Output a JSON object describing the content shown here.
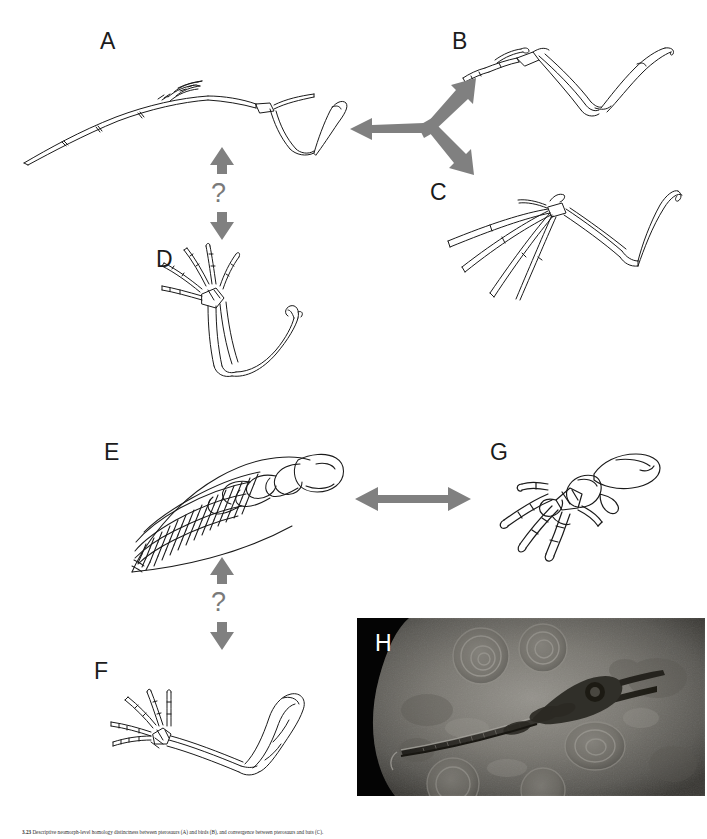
{
  "figure": {
    "background_color": "#ffffff",
    "arrow_color": "#808080",
    "ink_color": "#1a1a1a",
    "width": 707,
    "height": 839
  },
  "panels": [
    {
      "id": "A",
      "label": "A",
      "name": "pterosaur-wing",
      "description": "Pterosaur wing with hyper-elongated fourth digit",
      "label_x": 100,
      "label_y": 30
    },
    {
      "id": "B",
      "label": "B",
      "name": "bird-wing",
      "description": "Bird wing skeleton",
      "label_x": 452,
      "label_y": 30
    },
    {
      "id": "C",
      "label": "C",
      "name": "bat-wing",
      "description": "Bat wing with elongated digits",
      "label_x": 430,
      "label_y": 181
    },
    {
      "id": "D",
      "label": "D",
      "name": "generalized-tetrapod-forelimb",
      "description": "Generalized tetrapod forelimb with five short digits",
      "label_x": 156,
      "label_y": 248
    },
    {
      "id": "E",
      "label": "E",
      "name": "ichthyosaur-paddle",
      "description": "Ichthyosaur paddle with hyperphalangy",
      "label_x": 104,
      "label_y": 441
    },
    {
      "id": "F",
      "label": "F",
      "name": "generalized-forelimb",
      "description": "Generalized forelimb with humerus, radius, ulna and digits",
      "label_x": 94,
      "label_y": 660
    },
    {
      "id": "G",
      "label": "G",
      "name": "terrestrial-manus",
      "description": "Terrestrial manus with separate clawed digits",
      "label_x": 490,
      "label_y": 441
    },
    {
      "id": "H",
      "label": "H",
      "name": "ichthyosaur-fossil-photograph",
      "description": "Photograph of an ichthyosaur fossil in rock matrix with ammonites",
      "label_x": 375,
      "label_y": 632
    }
  ],
  "connectors": [
    {
      "name": "arrow-a-to-b-and-c",
      "type": "three-way-arrow",
      "from": "A",
      "to": [
        "B",
        "C"
      ],
      "question": false,
      "color": "#808080"
    },
    {
      "name": "arrow-a-to-d",
      "type": "double-headed-vertical-arrow",
      "from": "A",
      "to": "D",
      "question": true,
      "question_mark": "?",
      "color": "#808080"
    },
    {
      "name": "arrow-e-to-g",
      "type": "double-headed-horizontal-arrow",
      "from": "E",
      "to": "G",
      "question": false,
      "color": "#808080"
    },
    {
      "name": "arrow-e-to-f",
      "type": "double-headed-vertical-arrow",
      "from": "E",
      "to": "F",
      "question": true,
      "question_mark": "?",
      "color": "#808080"
    }
  ],
  "question_marks": [
    {
      "name": "question-mark-a-d",
      "text": "?",
      "x": 218,
      "y": 183
    },
    {
      "name": "question-mark-e-f",
      "text": "?",
      "x": 218,
      "y": 592
    }
  ],
  "caption": {
    "number": "3.23",
    "text": "Descriptive neomorph-level homology distinctness between pterosaurs (A) and birds (B), and convergence between pterosaurs and bats (C)."
  }
}
